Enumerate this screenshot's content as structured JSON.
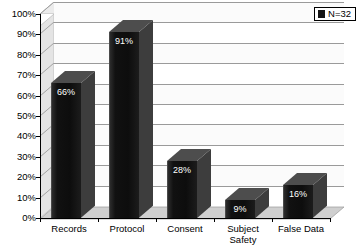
{
  "chart_data": {
    "type": "bar",
    "title": "",
    "xlabel": "",
    "ylabel": "",
    "categories": [
      "Records",
      "Protocol",
      "Consent",
      "Subject Safety",
      "False Data"
    ],
    "values": [
      66,
      91,
      28,
      9,
      16
    ],
    "data_labels": [
      "66%",
      "91%",
      "28%",
      "9%",
      "16%"
    ],
    "ylim": [
      0,
      100
    ],
    "ytick_labels": [
      "0%",
      "10%",
      "20%",
      "30%",
      "40%",
      "50%",
      "60%",
      "70%",
      "80%",
      "90%",
      "100%"
    ],
    "ytick_values": [
      0,
      10,
      20,
      30,
      40,
      50,
      60,
      70,
      80,
      90,
      100
    ],
    "grid": true,
    "grid_axis": "y",
    "legend": {
      "position": "top-right",
      "entries": [
        {
          "label": "N=32",
          "color": "#141414",
          "swatch_icon": "legend-swatch-icon"
        }
      ]
    },
    "style": {
      "three_d": true,
      "bar_color": "#111111",
      "bar_top_color": "#5a5a5a",
      "bar_side_color": "#3a3a3a",
      "plot_background": "#d9d9d9",
      "grid_band_color": "#ffffff",
      "grid_line_color": "#9a9a9a",
      "axis_color": "#000000",
      "label_text_color": "#ffffff",
      "tick_text_color": "#000000"
    }
  },
  "axis_category_lines": [
    [
      "Records"
    ],
    [
      "Protocol"
    ],
    [
      "Consent"
    ],
    [
      "Subject",
      "Safety"
    ],
    [
      "False Data"
    ]
  ]
}
